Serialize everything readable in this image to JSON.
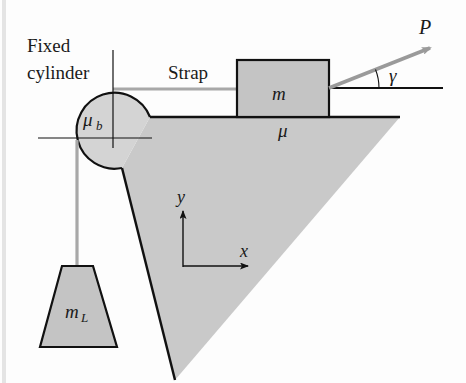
{
  "diagram": {
    "labels": {
      "fixed_cylinder_line1": "Fixed",
      "fixed_cylinder_line2": "cylinder",
      "strap": "Strap",
      "block_mass": "m",
      "surface_friction": "μ",
      "cylinder_friction_main": "μ",
      "cylinder_friction_sub": "b",
      "pull_force": "P",
      "pull_angle": "γ",
      "hanging_mass_main": "m",
      "hanging_mass_sub": "L",
      "axis_x": "x",
      "axis_y": "y"
    },
    "colors": {
      "outline": "#111111",
      "strap": "#a8a8a8",
      "wedge_fill": "#c9c9c9",
      "block_fill": "#c4c4c4",
      "cylinder_fill": "#d4d4d4",
      "arrow": "#9a9a9a",
      "background": "#fdfdfd"
    }
  }
}
